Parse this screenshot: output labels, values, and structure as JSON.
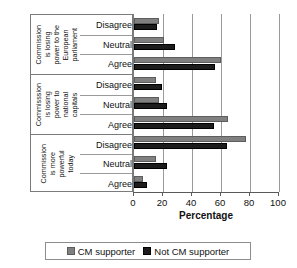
{
  "chart_data": {
    "type": "bar",
    "orientation": "horizontal",
    "title": "",
    "xlabel": "Percentage",
    "ylabel": "",
    "xlim": [
      0,
      100
    ],
    "xticks": [
      0,
      20,
      40,
      60,
      80,
      100
    ],
    "grid": true,
    "legend_position": "bottom",
    "series": [
      {
        "name": "CM supporter",
        "color": "#808080"
      },
      {
        "name": "Not CM supporter",
        "color": "#1c1c1c"
      }
    ],
    "groups": [
      {
        "label": "Commission\nis losing\npower to the\nEuropean\nparliament",
        "label_parts": [
          "Commission",
          "is losing",
          "power to the",
          "European",
          "parliament"
        ],
        "categories": [
          "Disagree",
          "Neutral",
          "Agree"
        ],
        "values": {
          "CM supporter": [
            17,
            21,
            60
          ],
          "Not CM supporter": [
            16,
            28,
            56
          ]
        }
      },
      {
        "label": "Commisssion\nis losing\npower to\nnational\ncapitals",
        "label_parts": [
          "Commisssion",
          "is losing",
          "power to",
          "national",
          "capitals"
        ],
        "categories": [
          "Disagree",
          "Neutral",
          "Agree"
        ],
        "values": {
          "CM supporter": [
            15,
            17,
            65
          ],
          "Not CM supporter": [
            19,
            23,
            55
          ]
        }
      },
      {
        "label": "Commission\nis more\npowerful\ntoday",
        "label_parts": [
          "Commission",
          "is more",
          "powerful",
          "today"
        ],
        "categories": [
          "Disagree",
          "Neutral",
          "Agree"
        ],
        "values": {
          "CM supporter": [
            77,
            15,
            6
          ],
          "Not CM supporter": [
            64,
            23,
            9
          ]
        }
      }
    ]
  },
  "axis": {
    "title": "Percentage",
    "tick_labels": [
      "0",
      "20",
      "40",
      "60",
      "80",
      "100"
    ]
  },
  "legend": {
    "items": [
      {
        "label": "CM supporter"
      },
      {
        "label": "Not CM supporter"
      }
    ]
  }
}
